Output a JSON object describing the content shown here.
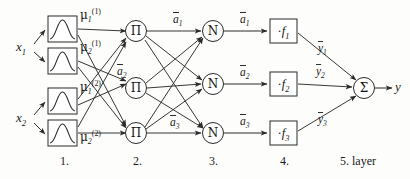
{
  "figure": {
    "background_color": "#fdfdfc",
    "stroke_color": "#2b2b2b"
  },
  "inputs": [
    {
      "name": "x1",
      "label": "x",
      "sub": "1",
      "x": 18,
      "y": 46
    },
    {
      "name": "x2",
      "label": "x",
      "sub": "2",
      "x": 18,
      "y": 117
    }
  ],
  "layer1": {
    "caption": "1.",
    "caption_x": 63,
    "caption_y": 163,
    "nodes": [
      {
        "name": "mf-x1-a",
        "greek": "μ",
        "sub": "1",
        "sup": "(1)",
        "box_x": 48,
        "box_y": 16,
        "label_x": 80,
        "label_y": 12
      },
      {
        "name": "mf-x1-b",
        "greek": "μ",
        "sub": "2",
        "sup": "(1)",
        "box_x": 48,
        "box_y": 48,
        "label_x": 80,
        "label_y": 44
      },
      {
        "name": "mf-x2-a",
        "greek": "μ",
        "sub": "1",
        "sup": "(2)",
        "box_x": 48,
        "box_y": 88,
        "label_x": 80,
        "label_y": 84
      },
      {
        "name": "mf-x2-b",
        "greek": "μ",
        "sub": "2",
        "sup": "(2)",
        "box_x": 48,
        "box_y": 120,
        "label_x": 80,
        "label_y": 132
      }
    ]
  },
  "layer2": {
    "caption": "2.",
    "caption_x": 140,
    "caption_y": 163,
    "glyph": "Π",
    "nodes": [
      {
        "name": "product-node-1",
        "cx": 136,
        "cy": 31
      },
      {
        "name": "product-node-2",
        "cx": 136,
        "cy": 88
      },
      {
        "name": "product-node-3",
        "cx": 136,
        "cy": 133
      }
    ],
    "edge_labels": [
      {
        "name": "a-bar-1-pre",
        "text": "a",
        "sub": "1",
        "x": 176,
        "y": 20
      },
      {
        "name": "a-bar-2-pre",
        "text": "a",
        "sub": "2",
        "x": 120,
        "y": 73
      },
      {
        "name": "a-bar-3-pre",
        "text": "a",
        "sub": "3",
        "x": 122,
        "y": 122
      }
    ]
  },
  "layer3": {
    "caption": "3.",
    "caption_x": 213,
    "caption_y": 163,
    "glyph": "N",
    "nodes": [
      {
        "name": "norm-node-1",
        "cx": 213,
        "cy": 31
      },
      {
        "name": "norm-node-2",
        "cx": 213,
        "cy": 84
      },
      {
        "name": "norm-node-3",
        "cx": 213,
        "cy": 133
      }
    ],
    "edge_labels": [
      {
        "name": "a-bar-1",
        "text": "a",
        "sub": "1",
        "x": 248,
        "y": 18
      },
      {
        "name": "a-bar-2",
        "text": "a",
        "sub": "2",
        "x": 248,
        "y": 71
      },
      {
        "name": "a-bar-3",
        "text": "a",
        "sub": "3",
        "x": 248,
        "y": 120
      }
    ]
  },
  "layer4": {
    "caption": "4.",
    "caption_x": 283,
    "caption_y": 163,
    "nodes": [
      {
        "name": "consequent-node-1",
        "text": "·f",
        "sub": "1",
        "box_x": 270,
        "box_y": 19
      },
      {
        "name": "consequent-node-2",
        "text": "·f",
        "sub": "2",
        "box_x": 270,
        "box_y": 72
      },
      {
        "name": "consequent-node-3",
        "text": "·f",
        "sub": "3",
        "box_x": 270,
        "box_y": 121
      }
    ],
    "edge_labels": [
      {
        "name": "y-bar-1",
        "text": "y",
        "sub": "1",
        "x": 320,
        "y": 48
      },
      {
        "name": "y-bar-2",
        "text": "y",
        "sub": "2",
        "x": 318,
        "y": 71
      },
      {
        "name": "y-bar-3",
        "text": "y",
        "sub": "3",
        "x": 320,
        "y": 120
      }
    ]
  },
  "layer5": {
    "caption": "5. layer",
    "caption_x": 347,
    "caption_y": 163,
    "glyph": "Σ",
    "node": {
      "name": "sum-node",
      "cx": 364,
      "cy": 88
    },
    "output": {
      "name": "output-y",
      "label": "y",
      "x": 395,
      "y": 82
    }
  }
}
